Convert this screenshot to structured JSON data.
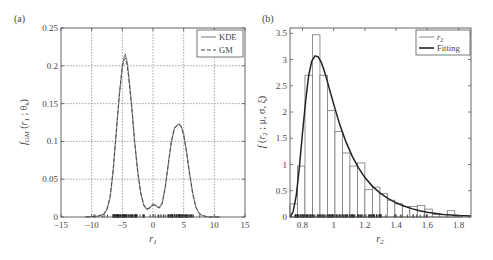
{
  "figure": {
    "panels": [
      "(a)",
      "(b)"
    ]
  },
  "chart_data": [
    {
      "id": "a",
      "panel_label": "(a)",
      "type": "line",
      "title": "",
      "xlabel": "r1",
      "xlabel_main": "r",
      "xlabel_sub": "1",
      "ylabel": "f_GM(r1 ; θk)",
      "xlim": [
        -15,
        15
      ],
      "ylim": [
        0,
        0.25
      ],
      "xticks": [
        -15,
        -10,
        -5,
        0,
        5,
        10,
        15
      ],
      "xtick_labels": [
        "−15",
        "−10",
        "−5",
        "0",
        "5",
        "10",
        "15"
      ],
      "yticks": [
        0,
        0.05,
        0.1,
        0.15,
        0.2,
        0.25
      ],
      "ytick_labels": [
        "0",
        "0.05",
        "0.1",
        "0.15",
        "0.2",
        "0.25"
      ],
      "grid": true,
      "legend": {
        "position": "upper right",
        "entries": [
          "KDE",
          "GM"
        ]
      },
      "series": [
        {
          "name": "KDE",
          "style": "solid",
          "x": [
            -11,
            -9,
            -8,
            -7.5,
            -7,
            -6.5,
            -6,
            -5.5,
            -5,
            -4.7,
            -4.5,
            -4.2,
            -4,
            -3.5,
            -3,
            -2.5,
            -2,
            -1.5,
            -1,
            -0.5,
            0,
            0.5,
            1,
            1.5,
            2,
            2.5,
            3,
            3.5,
            4,
            4.3,
            4.6,
            5,
            5.5,
            6,
            6.5,
            7,
            7.5,
            8,
            8.5,
            9,
            11
          ],
          "y": [
            0,
            0.001,
            0.004,
            0.01,
            0.025,
            0.06,
            0.11,
            0.16,
            0.2,
            0.212,
            0.215,
            0.205,
            0.19,
            0.15,
            0.1,
            0.06,
            0.032,
            0.015,
            0.01,
            0.012,
            0.017,
            0.015,
            0.012,
            0.018,
            0.04,
            0.07,
            0.1,
            0.118,
            0.122,
            0.123,
            0.12,
            0.11,
            0.085,
            0.055,
            0.03,
            0.013,
            0.005,
            0.002,
            0.001,
            0,
            0
          ]
        },
        {
          "name": "GM",
          "style": "dashed",
          "x": [
            -11,
            -9,
            -8,
            -7.5,
            -7,
            -6.5,
            -6,
            -5.5,
            -5,
            -4.7,
            -4.5,
            -4.2,
            -4,
            -3.5,
            -3,
            -2.5,
            -2,
            -1.5,
            -1,
            -0.5,
            0,
            0.5,
            1,
            1.5,
            2,
            2.5,
            3,
            3.5,
            4,
            4.3,
            4.6,
            5,
            5.5,
            6,
            6.5,
            7,
            7.5,
            8,
            8.5,
            9,
            11
          ],
          "y": [
            0,
            0.001,
            0.004,
            0.011,
            0.027,
            0.062,
            0.112,
            0.162,
            0.198,
            0.208,
            0.21,
            0.2,
            0.186,
            0.148,
            0.1,
            0.06,
            0.032,
            0.016,
            0.011,
            0.012,
            0.016,
            0.015,
            0.012,
            0.018,
            0.04,
            0.07,
            0.1,
            0.117,
            0.121,
            0.122,
            0.119,
            0.108,
            0.084,
            0.055,
            0.03,
            0.013,
            0.005,
            0.002,
            0.001,
            0,
            0
          ]
        }
      ],
      "rug": {
        "description": "sample points along x-axis",
        "x_range": [
          -10,
          9
        ],
        "dense_ranges": [
          [
            -6.5,
            -2.5
          ],
          [
            2.5,
            6.5
          ]
        ]
      }
    },
    {
      "id": "b",
      "panel_label": "(b)",
      "type": "bar",
      "title": "",
      "xlabel": "r2",
      "xlabel_main": "r",
      "xlabel_sub": "2",
      "ylabel": "f(r2 ; μ, σ, ξ)",
      "xlim": [
        0.72,
        1.88
      ],
      "ylim": [
        0,
        3.6
      ],
      "xticks": [
        0.8,
        1.0,
        1.2,
        1.4,
        1.6,
        1.8
      ],
      "xtick_labels": [
        "0.8",
        "1",
        "1.2",
        "1.4",
        "1.6",
        "1.8"
      ],
      "yticks": [
        0,
        0.5,
        1,
        1.5,
        2,
        2.5,
        3,
        3.5
      ],
      "ytick_labels": [
        "0",
        "0.5",
        "1",
        "1.5",
        "2",
        "2.5",
        "3",
        "3.5"
      ],
      "grid": false,
      "legend": {
        "position": "upper right",
        "entries": [
          "r2",
          "Fitting"
        ]
      },
      "histogram": {
        "name": "r2",
        "bin_width": 0.048,
        "bin_starts": [
          0.72,
          0.768,
          0.816,
          0.864,
          0.912,
          0.96,
          1.008,
          1.056,
          1.104,
          1.152,
          1.2,
          1.248,
          1.296,
          1.344,
          1.392,
          1.44,
          1.488,
          1.536,
          1.584,
          1.632,
          1.68,
          1.728,
          1.776,
          1.824
        ],
        "values": [
          0.25,
          0.97,
          2.7,
          3.47,
          2.7,
          2.03,
          1.63,
          1.22,
          0.97,
          1.03,
          0.52,
          0.57,
          0.45,
          0.32,
          0.25,
          0.2,
          0.2,
          0.22,
          0.15,
          0.05,
          0.05,
          0.12,
          0.02,
          0
        ]
      },
      "series": [
        {
          "name": "Fitting",
          "style": "solid-thick",
          "x": [
            0.72,
            0.74,
            0.76,
            0.78,
            0.8,
            0.82,
            0.84,
            0.86,
            0.88,
            0.9,
            0.92,
            0.94,
            0.96,
            0.98,
            1.0,
            1.04,
            1.08,
            1.12,
            1.16,
            1.2,
            1.25,
            1.3,
            1.35,
            1.4,
            1.45,
            1.5,
            1.55,
            1.6,
            1.7,
            1.8,
            1.88
          ],
          "y": [
            0.0,
            0.1,
            0.4,
            0.95,
            1.6,
            2.2,
            2.7,
            2.97,
            3.07,
            3.05,
            2.95,
            2.78,
            2.58,
            2.36,
            2.15,
            1.75,
            1.42,
            1.15,
            0.93,
            0.75,
            0.58,
            0.45,
            0.35,
            0.27,
            0.21,
            0.16,
            0.12,
            0.09,
            0.05,
            0.03,
            0.02
          ]
        }
      ],
      "rug": {
        "description": "sample points along x-axis",
        "x_range": [
          0.75,
          1.6
        ],
        "dense_ranges": [
          [
            0.75,
            1.3
          ]
        ]
      }
    }
  ]
}
